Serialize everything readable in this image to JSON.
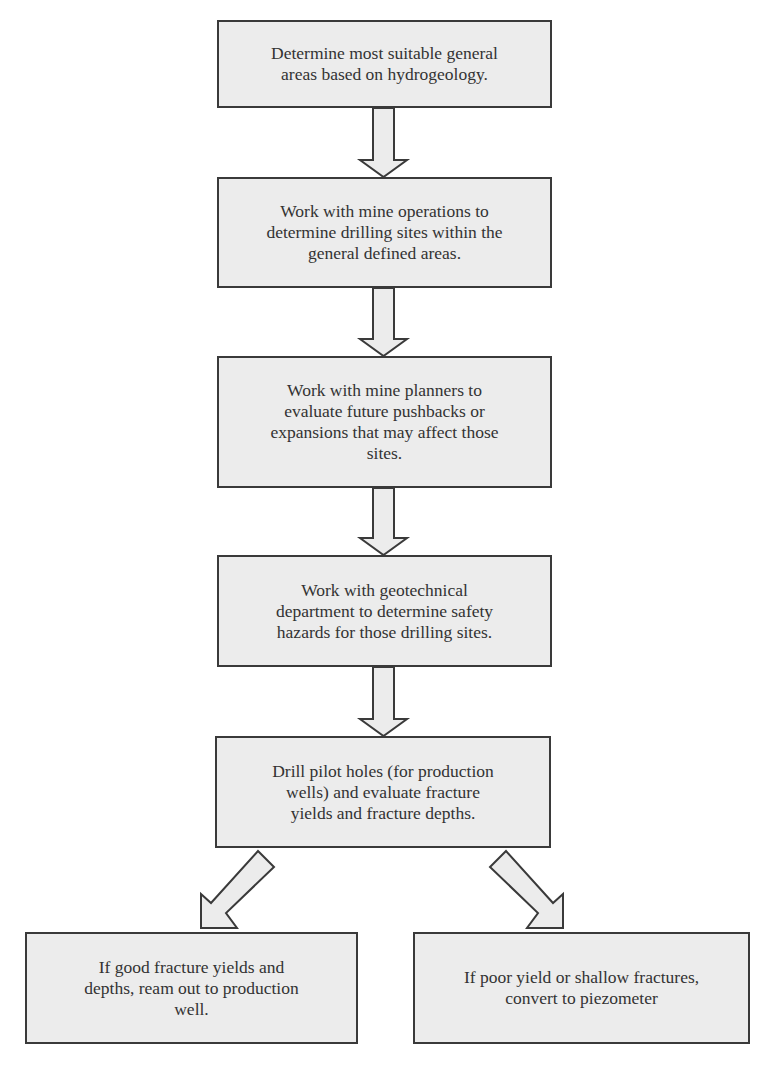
{
  "diagram": {
    "type": "flowchart",
    "colors": {
      "box_fill": "#ececec",
      "border": "#3a3a3a",
      "text": "#333333",
      "background": "#ffffff"
    },
    "steps": [
      {
        "id": "step1",
        "lines": [
          "Determine most suitable general",
          "areas based on hydrogeology."
        ]
      },
      {
        "id": "step2",
        "lines": [
          "Work with mine operations to",
          "determine drilling sites within the",
          "general defined areas."
        ]
      },
      {
        "id": "step3",
        "lines": [
          "Work with mine planners to",
          "evaluate future pushbacks or",
          "expansions that may affect those",
          "sites."
        ]
      },
      {
        "id": "step4",
        "lines": [
          "Work with geotechnical",
          "department to determine safety",
          "hazards for those drilling sites."
        ]
      },
      {
        "id": "step5",
        "lines": [
          "Drill pilot holes (for production",
          "wells) and evaluate fracture",
          "yields and fracture depths."
        ]
      },
      {
        "id": "outcome-good",
        "lines": [
          "If good fracture yields and",
          "depths, ream out to production",
          "well."
        ]
      },
      {
        "id": "outcome-poor",
        "lines": [
          "If poor yield or shallow fractures,",
          "convert to piezometer"
        ]
      }
    ],
    "connections": [
      {
        "from": "step1",
        "to": "step2",
        "direction": "down"
      },
      {
        "from": "step2",
        "to": "step3",
        "direction": "down"
      },
      {
        "from": "step3",
        "to": "step4",
        "direction": "down"
      },
      {
        "from": "step4",
        "to": "step5",
        "direction": "down"
      },
      {
        "from": "step5",
        "to": "outcome-good",
        "direction": "down-left"
      },
      {
        "from": "step5",
        "to": "outcome-poor",
        "direction": "down-right"
      }
    ]
  }
}
